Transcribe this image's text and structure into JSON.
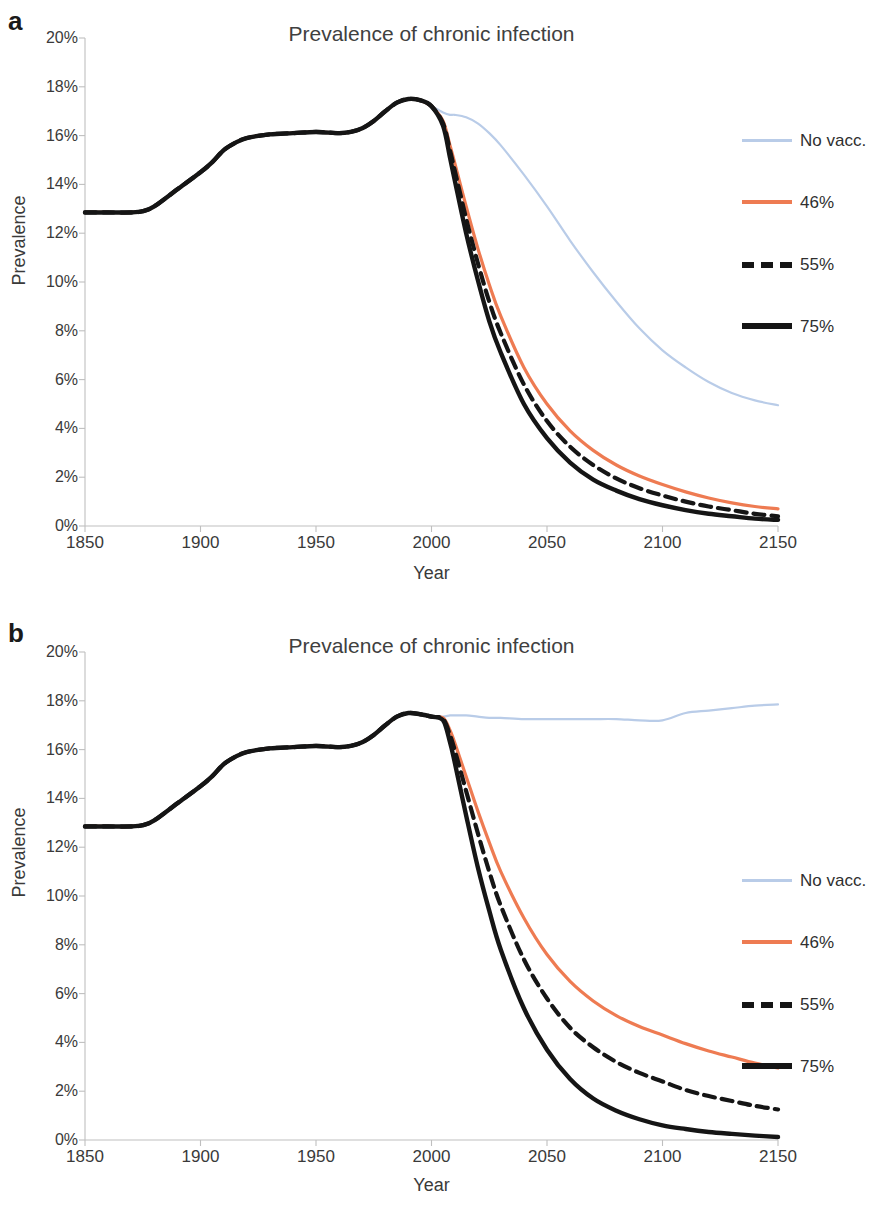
{
  "figure": {
    "panels": [
      {
        "letter": "a",
        "title": "Prevalence of chronic infection",
        "xlabel": "Year",
        "ylabel": "Prevalence"
      },
      {
        "letter": "b",
        "title": "Prevalence of chronic infection",
        "xlabel": "Year",
        "ylabel": "Prevalence"
      }
    ]
  },
  "colors": {
    "no_vacc": "#b9cce8",
    "cov46": "#ee7b52",
    "cov55": "#151515",
    "cov75": "#151515",
    "axis": "#bfbfbf",
    "text": "#3a3a3a"
  },
  "legend": {
    "entries": [
      {
        "label": "No vacc.",
        "color": "#b9cce8",
        "style": "thin-solid"
      },
      {
        "label": "46%",
        "color": "#ee7b52",
        "style": "solid"
      },
      {
        "label": "55%",
        "color": "#151515",
        "style": "dashed"
      },
      {
        "label": "75%",
        "color": "#151515",
        "style": "thick-solid"
      }
    ]
  },
  "axes": {
    "x_ticks": [
      "1850",
      "1900",
      "1950",
      "2000",
      "2050",
      "2100",
      "2150"
    ],
    "x_tick_values": [
      1850,
      1900,
      1950,
      2000,
      2050,
      2100,
      2150
    ],
    "y_ticks": [
      "0%",
      "2%",
      "4%",
      "6%",
      "8%",
      "10%",
      "12%",
      "14%",
      "16%",
      "18%",
      "20%"
    ],
    "y_tick_values": [
      0,
      2,
      4,
      6,
      8,
      10,
      12,
      14,
      16,
      18,
      20
    ],
    "xlim": [
      1850,
      2150
    ],
    "ylim": [
      0,
      20
    ]
  },
  "chart_data": [
    {
      "type": "line",
      "panel": "a",
      "title": "Prevalence of chronic infection",
      "xlabel": "Year",
      "ylabel": "Prevalence",
      "xlim": [
        1850,
        2150
      ],
      "ylim": [
        0,
        20
      ],
      "grid": false,
      "legend_position": "right",
      "x": [
        1850,
        1860,
        1870,
        1875,
        1880,
        1890,
        1900,
        1905,
        1910,
        1915,
        1920,
        1930,
        1940,
        1950,
        1960,
        1965,
        1970,
        1975,
        1980,
        1985,
        1990,
        1995,
        2000,
        2005,
        2008,
        2010,
        2015,
        2020,
        2025,
        2030,
        2040,
        2050,
        2060,
        2070,
        2080,
        2090,
        2100,
        2110,
        2120,
        2130,
        2140,
        2150
      ],
      "series": [
        {
          "name": "No vacc.",
          "color": "#b9cce8",
          "style": "thin-solid",
          "values": [
            12.85,
            12.85,
            12.85,
            12.9,
            13.1,
            13.8,
            14.5,
            14.9,
            15.4,
            15.7,
            15.9,
            16.05,
            16.1,
            16.15,
            16.1,
            16.15,
            16.3,
            16.6,
            17.0,
            17.35,
            17.5,
            17.45,
            17.2,
            16.95,
            16.85,
            16.85,
            16.75,
            16.5,
            16.1,
            15.6,
            14.4,
            13.1,
            11.7,
            10.4,
            9.2,
            8.1,
            7.2,
            6.5,
            5.9,
            5.45,
            5.15,
            4.95
          ]
        },
        {
          "name": "46%",
          "color": "#ee7b52",
          "style": "solid",
          "values": [
            12.85,
            12.85,
            12.85,
            12.9,
            13.1,
            13.8,
            14.5,
            14.9,
            15.4,
            15.7,
            15.9,
            16.05,
            16.1,
            16.15,
            16.1,
            16.15,
            16.3,
            16.6,
            17.0,
            17.35,
            17.5,
            17.45,
            17.2,
            16.6,
            15.6,
            14.9,
            13.1,
            11.4,
            9.9,
            8.6,
            6.5,
            5.0,
            3.9,
            3.1,
            2.5,
            2.05,
            1.7,
            1.4,
            1.15,
            0.95,
            0.8,
            0.7
          ]
        },
        {
          "name": "55%",
          "color": "#151515",
          "style": "dashed",
          "values": [
            12.85,
            12.85,
            12.85,
            12.9,
            13.1,
            13.8,
            14.5,
            14.9,
            15.4,
            15.7,
            15.9,
            16.05,
            16.1,
            16.15,
            16.1,
            16.15,
            16.3,
            16.6,
            17.0,
            17.35,
            17.5,
            17.45,
            17.2,
            16.5,
            15.4,
            14.6,
            12.6,
            10.8,
            9.2,
            7.9,
            5.8,
            4.3,
            3.25,
            2.5,
            1.95,
            1.55,
            1.25,
            1.0,
            0.8,
            0.65,
            0.5,
            0.4
          ]
        },
        {
          "name": "75%",
          "color": "#151515",
          "style": "thick-solid",
          "values": [
            12.85,
            12.85,
            12.85,
            12.9,
            13.1,
            13.8,
            14.5,
            14.9,
            15.4,
            15.7,
            15.9,
            16.05,
            16.1,
            16.15,
            16.1,
            16.15,
            16.3,
            16.6,
            17.0,
            17.35,
            17.5,
            17.45,
            17.2,
            16.4,
            15.1,
            14.2,
            12.0,
            10.1,
            8.4,
            7.1,
            5.0,
            3.6,
            2.6,
            1.9,
            1.45,
            1.1,
            0.85,
            0.65,
            0.5,
            0.4,
            0.3,
            0.25
          ]
        }
      ]
    },
    {
      "type": "line",
      "panel": "b",
      "title": "Prevalence of chronic infection",
      "xlabel": "Year",
      "ylabel": "Prevalence",
      "xlim": [
        1850,
        2150
      ],
      "ylim": [
        0,
        20
      ],
      "grid": false,
      "legend_position": "right",
      "x": [
        1850,
        1860,
        1870,
        1875,
        1880,
        1890,
        1900,
        1905,
        1910,
        1915,
        1920,
        1930,
        1940,
        1950,
        1960,
        1965,
        1970,
        1975,
        1980,
        1985,
        1990,
        1995,
        2000,
        2005,
        2008,
        2010,
        2015,
        2020,
        2025,
        2030,
        2040,
        2050,
        2060,
        2070,
        2080,
        2090,
        2100,
        2110,
        2120,
        2130,
        2140,
        2150
      ],
      "series": [
        {
          "name": "No vacc.",
          "color": "#b9cce8",
          "style": "thin-solid",
          "values": [
            12.85,
            12.85,
            12.85,
            12.9,
            13.1,
            13.8,
            14.5,
            14.9,
            15.4,
            15.7,
            15.9,
            16.05,
            16.1,
            16.15,
            16.1,
            16.15,
            16.3,
            16.6,
            17.0,
            17.35,
            17.5,
            17.45,
            17.35,
            17.35,
            17.4,
            17.4,
            17.4,
            17.35,
            17.3,
            17.3,
            17.25,
            17.25,
            17.25,
            17.25,
            17.25,
            17.2,
            17.2,
            17.5,
            17.6,
            17.7,
            17.8,
            17.85
          ]
        },
        {
          "name": "46%",
          "color": "#ee7b52",
          "style": "solid",
          "values": [
            12.85,
            12.85,
            12.85,
            12.9,
            13.1,
            13.8,
            14.5,
            14.9,
            15.4,
            15.7,
            15.9,
            16.05,
            16.1,
            16.15,
            16.1,
            16.15,
            16.3,
            16.6,
            17.0,
            17.35,
            17.5,
            17.45,
            17.35,
            17.3,
            16.8,
            16.3,
            14.9,
            13.5,
            12.2,
            11.0,
            9.1,
            7.6,
            6.5,
            5.7,
            5.1,
            4.65,
            4.3,
            3.95,
            3.65,
            3.4,
            3.15,
            2.95
          ]
        },
        {
          "name": "55%",
          "color": "#151515",
          "style": "dashed",
          "values": [
            12.85,
            12.85,
            12.85,
            12.9,
            13.1,
            13.8,
            14.5,
            14.9,
            15.4,
            15.7,
            15.9,
            16.05,
            16.1,
            16.15,
            16.1,
            16.15,
            16.3,
            16.6,
            17.0,
            17.35,
            17.5,
            17.45,
            17.35,
            17.25,
            16.6,
            16.0,
            14.3,
            12.6,
            11.0,
            9.6,
            7.4,
            5.8,
            4.6,
            3.8,
            3.2,
            2.75,
            2.4,
            2.05,
            1.8,
            1.6,
            1.4,
            1.25
          ]
        },
        {
          "name": "75%",
          "color": "#151515",
          "style": "thick-solid",
          "values": [
            12.85,
            12.85,
            12.85,
            12.9,
            13.1,
            13.8,
            14.5,
            14.9,
            15.4,
            15.7,
            15.9,
            16.05,
            16.1,
            16.15,
            16.1,
            16.15,
            16.3,
            16.6,
            17.0,
            17.35,
            17.5,
            17.45,
            17.35,
            17.2,
            16.3,
            15.5,
            13.3,
            11.2,
            9.4,
            7.8,
            5.4,
            3.7,
            2.5,
            1.7,
            1.2,
            0.85,
            0.6,
            0.45,
            0.33,
            0.25,
            0.18,
            0.12
          ]
        }
      ]
    }
  ]
}
